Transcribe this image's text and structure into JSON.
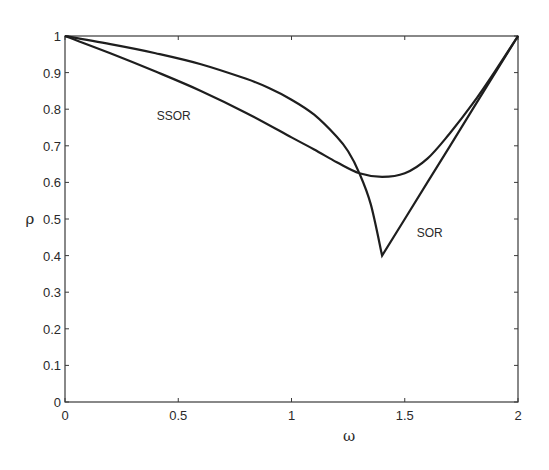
{
  "chart_data": {
    "type": "line",
    "title": "",
    "xlabel": "ω",
    "ylabel": "ρ",
    "xlim": [
      0,
      2
    ],
    "ylim": [
      0,
      1
    ],
    "grid": false,
    "legend": "none (inline labels)",
    "x_ticks": [
      0,
      0.5,
      1,
      1.5,
      2
    ],
    "x_tick_labels": [
      "0",
      "0.5",
      "1",
      "1.5",
      "2"
    ],
    "y_ticks": [
      0,
      0.1,
      0.2,
      0.3,
      0.4,
      0.5,
      0.6,
      0.7,
      0.8,
      0.9,
      1
    ],
    "y_tick_labels": [
      "0",
      "0.1",
      "0.2",
      "0.3",
      "0.4",
      "0.5",
      "0.6",
      "0.7",
      "0.8",
      "0.9",
      "1"
    ],
    "series": [
      {
        "name": "SOR",
        "x": [
          0,
          0.2,
          0.4,
          0.6,
          0.8,
          0.9,
          1.0,
          1.1,
          1.2,
          1.25,
          1.3,
          1.35,
          1.4,
          1.5,
          1.6,
          1.7,
          1.8,
          1.9,
          2.0
        ],
        "values": [
          1.0,
          0.978,
          0.953,
          0.923,
          0.883,
          0.858,
          0.826,
          0.785,
          0.725,
          0.685,
          0.625,
          0.54,
          0.4,
          0.5,
          0.6,
          0.7,
          0.8,
          0.9,
          1.0
        ]
      },
      {
        "name": "SSOR",
        "x": [
          0,
          0.2,
          0.4,
          0.6,
          0.8,
          1.0,
          1.1,
          1.2,
          1.3,
          1.4,
          1.5,
          1.6,
          1.7,
          1.8,
          1.9,
          2.0
        ],
        "values": [
          1.0,
          0.953,
          0.903,
          0.85,
          0.79,
          0.723,
          0.69,
          0.655,
          0.625,
          0.615,
          0.625,
          0.665,
          0.735,
          0.815,
          0.905,
          1.0
        ]
      }
    ],
    "annotations": [
      {
        "text": "SSOR",
        "x": 0.48,
        "y": 0.77
      },
      {
        "text": "SOR",
        "x": 1.61,
        "y": 0.45
      }
    ]
  }
}
